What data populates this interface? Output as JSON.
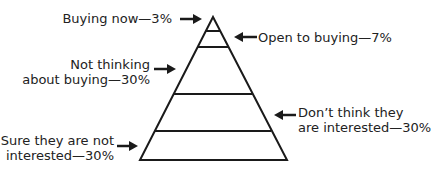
{
  "diagram": {
    "type": "pyramid",
    "segments": [
      {
        "label": "Buying now",
        "percent": "3%",
        "text": "Buying now—3%"
      },
      {
        "label": "Open to buying",
        "percent": "7%",
        "text": "Open to buying—7%"
      },
      {
        "label": "Not thinking about buying",
        "percent": "30%",
        "line1": "Not thinking",
        "line2": "about buying—30%"
      },
      {
        "label": "Don't think they are interested",
        "percent": "30%",
        "line1": "Don’t think they",
        "line2": "are interested—30%"
      },
      {
        "label": "Sure they are not interested",
        "percent": "30%",
        "line1": "Sure they are not",
        "line2": "interested—30%"
      }
    ],
    "colors": {
      "line": "#1a1a1a",
      "text": "#222222",
      "background": "#ffffff"
    }
  }
}
